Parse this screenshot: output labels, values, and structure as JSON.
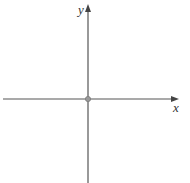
{
  "diagram": {
    "type": "cartesian-axes",
    "x_axis": {
      "label": "x",
      "direction": "right",
      "has_arrow": true
    },
    "y_axis": {
      "label": "y",
      "direction": "up",
      "has_arrow": true
    },
    "origin": {
      "marked": true,
      "marker": "small-circle"
    },
    "colors": {
      "axis": "#555555",
      "origin_marker": "#8a8a8a",
      "label": "#333333",
      "background": "#ffffff"
    }
  }
}
